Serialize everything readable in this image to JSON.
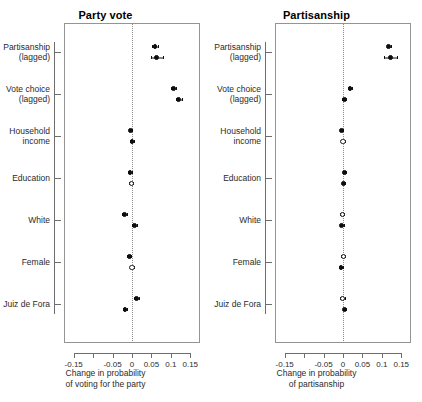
{
  "figure": {
    "panels": [
      {
        "id": "party-vote",
        "title": "Party vote",
        "xlabel_line1": "Change in probability",
        "xlabel_line2": "of voting for the party"
      },
      {
        "id": "partisanship",
        "title": "Partisanship",
        "xlabel_line1": "Change in probability",
        "xlabel_line2": "of partisanship"
      }
    ],
    "categories": [
      {
        "line1": "Partisanship",
        "line2": "(lagged)"
      },
      {
        "line1": "Vote choice",
        "line2": "(lagged)"
      },
      {
        "line1": "Household",
        "line2": "income"
      },
      {
        "line1": "Education",
        "line2": ""
      },
      {
        "line1": "White",
        "line2": ""
      },
      {
        "line1": "Female",
        "line2": ""
      },
      {
        "line1": "Juiz de Fora",
        "line2": ""
      }
    ],
    "xticks": [
      {
        "value": -0.15,
        "label": "-0.15"
      },
      {
        "value": -0.1,
        "label": ""
      },
      {
        "value": -0.05,
        "label": "-0.05"
      },
      {
        "value": 0,
        "label": "0"
      },
      {
        "value": 0.05,
        "label": "0.05"
      },
      {
        "value": 0.1,
        "label": "0.1"
      },
      {
        "value": 0.15,
        "label": "0.15"
      }
    ],
    "colors": {
      "point_filled": "#0d0d0d",
      "point_open": "#ffffff",
      "axis": "#6e6e6e",
      "frame": "#949494",
      "zeroline": "#8a8a8a"
    }
  },
  "chart_data": {
    "type": "scatter",
    "xlabel": "Change in probability",
    "ylabel": "",
    "xlim": [
      -0.175,
      0.175
    ],
    "grid": false,
    "legend": "none",
    "reference_line": 0,
    "marker_semantics": {
      "filled": "estimate significant / solid circle",
      "open": "estimate not significant / hollow circle"
    },
    "categories": [
      "Partisanship (lagged)",
      "Vote choice (lagged)",
      "Household income",
      "Education",
      "White",
      "Female",
      "Juiz de Fora"
    ],
    "panels": [
      {
        "name": "Party vote",
        "xlabel": "Change in probability of voting for the party",
        "series": [
          {
            "name": "estimate 1",
            "points": [
              {
                "category": "Partisanship (lagged)",
                "value": 0.059,
                "ci_low": 0.052,
                "ci_high": 0.066,
                "marker": "filled"
              },
              {
                "category": "Vote choice (lagged)",
                "value": 0.107,
                "ci_low": 0.1,
                "ci_high": 0.114,
                "marker": "filled"
              },
              {
                "category": "Household income",
                "value": -0.004,
                "ci_low": -0.008,
                "ci_high": 0.0,
                "marker": "filled"
              },
              {
                "category": "Education",
                "value": -0.005,
                "ci_low": -0.01,
                "ci_high": 0.0,
                "marker": "filled"
              },
              {
                "category": "White",
                "value": -0.019,
                "ci_low": -0.025,
                "ci_high": -0.013,
                "marker": "filled"
              },
              {
                "category": "Female",
                "value": -0.007,
                "ci_low": -0.012,
                "ci_high": -0.002,
                "marker": "filled"
              },
              {
                "category": "Juiz de Fora",
                "value": 0.012,
                "ci_low": 0.006,
                "ci_high": 0.018,
                "marker": "filled"
              }
            ]
          },
          {
            "name": "estimate 2",
            "points": [
              {
                "category": "Partisanship (lagged)",
                "value": 0.064,
                "ci_low": 0.048,
                "ci_high": 0.081,
                "marker": "filled"
              },
              {
                "category": "Vote choice (lagged)",
                "value": 0.12,
                "ci_low": 0.112,
                "ci_high": 0.128,
                "marker": "filled"
              },
              {
                "category": "Household income",
                "value": 0.0,
                "ci_low": -0.005,
                "ci_high": 0.005,
                "marker": "filled"
              },
              {
                "category": "Education",
                "value": -0.002,
                "ci_low": -0.007,
                "ci_high": 0.003,
                "marker": "open"
              },
              {
                "category": "White",
                "value": 0.006,
                "ci_low": 0.0,
                "ci_high": 0.012,
                "marker": "filled"
              },
              {
                "category": "Female",
                "value": 0.0,
                "ci_low": -0.005,
                "ci_high": 0.005,
                "marker": "open"
              },
              {
                "category": "Juiz de Fora",
                "value": -0.018,
                "ci_low": -0.024,
                "ci_high": -0.012,
                "marker": "filled"
              }
            ]
          }
        ]
      },
      {
        "name": "Partisanship",
        "xlabel": "Change in probability of partisanship",
        "series": [
          {
            "name": "estimate 1",
            "points": [
              {
                "category": "Partisanship (lagged)",
                "value": 0.118,
                "ci_low": 0.112,
                "ci_high": 0.124,
                "marker": "filled"
              },
              {
                "category": "Vote choice (lagged)",
                "value": 0.018,
                "ci_low": 0.013,
                "ci_high": 0.023,
                "marker": "filled"
              },
              {
                "category": "Household income",
                "value": -0.004,
                "ci_low": -0.008,
                "ci_high": 0.0,
                "marker": "filled"
              },
              {
                "category": "Education",
                "value": 0.003,
                "ci_low": -0.001,
                "ci_high": 0.007,
                "marker": "filled"
              },
              {
                "category": "White",
                "value": -0.002,
                "ci_low": -0.007,
                "ci_high": 0.003,
                "marker": "open"
              },
              {
                "category": "Female",
                "value": 0.001,
                "ci_low": -0.004,
                "ci_high": 0.006,
                "marker": "open"
              },
              {
                "category": "Juiz de Fora",
                "value": -0.001,
                "ci_low": -0.007,
                "ci_high": 0.005,
                "marker": "open"
              }
            ]
          },
          {
            "name": "estimate 2",
            "points": [
              {
                "category": "Partisanship (lagged)",
                "value": 0.122,
                "ci_low": 0.106,
                "ci_high": 0.138,
                "marker": "filled"
              },
              {
                "category": "Vote choice (lagged)",
                "value": 0.003,
                "ci_low": -0.002,
                "ci_high": 0.008,
                "marker": "filled"
              },
              {
                "category": "Household income",
                "value": 0.0,
                "ci_low": -0.004,
                "ci_high": 0.004,
                "marker": "open"
              },
              {
                "category": "Education",
                "value": 0.001,
                "ci_low": -0.003,
                "ci_high": 0.005,
                "marker": "filled"
              },
              {
                "category": "White",
                "value": -0.003,
                "ci_low": -0.008,
                "ci_high": 0.002,
                "marker": "filled"
              },
              {
                "category": "Female",
                "value": -0.005,
                "ci_low": -0.01,
                "ci_high": 0.0,
                "marker": "filled"
              },
              {
                "category": "Juiz de Fora",
                "value": 0.004,
                "ci_low": -0.001,
                "ci_high": 0.009,
                "marker": "filled"
              }
            ]
          }
        ]
      }
    ]
  }
}
